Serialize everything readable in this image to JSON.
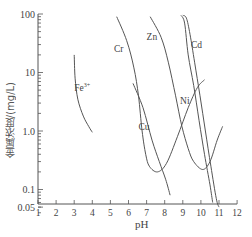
{
  "chart_data": {
    "type": "line",
    "title": "",
    "xlabel": "pH",
    "ylabel": "金属浓度/(mg/L)",
    "yscale": "log",
    "xlim": [
      1,
      12
    ],
    "ylim": [
      0.04,
      100
    ],
    "x_ticks": [
      1,
      2,
      3,
      4,
      5,
      6,
      7,
      8,
      9,
      10,
      11,
      12
    ],
    "y_tick_labels": [
      "100",
      "10",
      "1.0",
      "0.1",
      "0.05"
    ],
    "y_ticks": [
      100,
      10,
      1.0,
      0.1,
      0.05
    ],
    "grid": false,
    "legend": "inline labels",
    "series": [
      {
        "name": "Fe3+",
        "label": "Fe",
        "label_sup": "3+",
        "points": [
          [
            3.0,
            20
          ],
          [
            3.05,
            8
          ],
          [
            3.2,
            3.5
          ],
          [
            3.5,
            1.8
          ],
          [
            3.8,
            1.2
          ],
          [
            4.0,
            0.95
          ]
        ]
      },
      {
        "name": "Cr",
        "label": "Cr",
        "points": [
          [
            5.35,
            90
          ],
          [
            5.9,
            35
          ],
          [
            6.3,
            12
          ],
          [
            6.55,
            4
          ],
          [
            6.75,
            1.0
          ],
          [
            6.95,
            0.4
          ],
          [
            7.15,
            0.25
          ],
          [
            7.6,
            0.2
          ],
          [
            8.1,
            0.28
          ],
          [
            8.7,
            0.8
          ],
          [
            9.3,
            2.5
          ],
          [
            9.8,
            5.5
          ],
          [
            10.2,
            7.5
          ]
        ]
      },
      {
        "name": "Cu",
        "label": "Cu",
        "points": [
          [
            6.25,
            6.5
          ],
          [
            6.8,
            2.5
          ],
          [
            7.3,
            0.7
          ],
          [
            7.7,
            0.3
          ],
          [
            8.05,
            0.15
          ],
          [
            8.3,
            0.08
          ]
        ]
      },
      {
        "name": "Zn",
        "label": "Zn",
        "points": [
          [
            7.2,
            90
          ],
          [
            7.8,
            40
          ],
          [
            8.2,
            15
          ],
          [
            8.6,
            4
          ],
          [
            8.95,
            1.2
          ],
          [
            9.3,
            0.5
          ],
          [
            9.6,
            0.3
          ],
          [
            10.1,
            0.22
          ],
          [
            10.5,
            0.3
          ],
          [
            10.9,
            0.7
          ],
          [
            11.2,
            1.2
          ]
        ]
      },
      {
        "name": "Ni",
        "label": "Ni",
        "points": [
          [
            8.9,
            95
          ],
          [
            9.1,
            70
          ],
          [
            9.3,
            20
          ],
          [
            9.6,
            6
          ],
          [
            9.9,
            1.5
          ],
          [
            10.2,
            0.4
          ],
          [
            10.5,
            0.12
          ],
          [
            10.65,
            0.06
          ]
        ]
      },
      {
        "name": "Cd",
        "label": "Cd",
        "points": [
          [
            9.0,
            95
          ],
          [
            9.2,
            85
          ],
          [
            9.4,
            45
          ],
          [
            9.65,
            15
          ],
          [
            9.95,
            4
          ],
          [
            10.25,
            1.0
          ],
          [
            10.55,
            0.25
          ],
          [
            10.85,
            0.07
          ],
          [
            11.0,
            0.05
          ]
        ]
      }
    ],
    "label_positions": {
      "Fe3+": [
        3.0,
        5.5
      ],
      "Cr": [
        5.2,
        25
      ],
      "Cu": [
        6.55,
        1.15
      ],
      "Zn": [
        7.0,
        40
      ],
      "Ni": [
        8.85,
        3.2
      ],
      "Cd": [
        9.45,
        30
      ]
    }
  },
  "axis_labels": {
    "x": "pH",
    "y": "金属浓度/(mg/L)"
  }
}
